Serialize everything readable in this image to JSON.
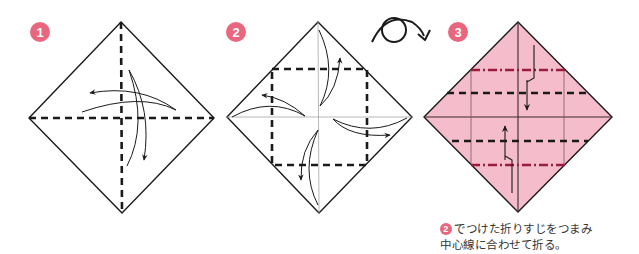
{
  "colors": {
    "badge": "#e8677e",
    "paper_fill": "#f5bccb",
    "line": "#1a1a1a",
    "crease_valley": "#1a1a1a",
    "crease_mountain": "#9b1c3e",
    "faint_crease": "#6e4a55"
  },
  "steps": [
    {
      "number": "1",
      "description": "Square diamond folded along both diagonals (dashed) with curved arrows"
    },
    {
      "number": "2",
      "description": "Corners folded to center along dashed square, then unfolded (curved arrows)"
    },
    {
      "number": "3",
      "description": "Pink paper: pinch creases and fold to center line (dashed and dash-dot lines with zigzag arrows)"
    }
  ],
  "turnover_icon": "flip-over-icon",
  "caption": {
    "badge": "2",
    "line1": "でつけた折りすじをつまみ",
    "line2": "中心線に合わせて折る。"
  }
}
